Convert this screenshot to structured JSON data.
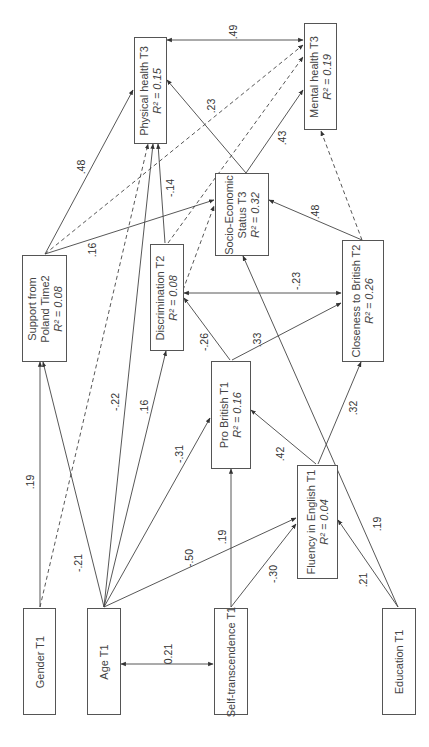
{
  "nodes": {
    "physical_health": {
      "label": "Physical health T3",
      "r2": "R² = 0.15"
    },
    "mental_health": {
      "label": "Mental health T3",
      "r2": "R² = 0.19"
    },
    "ses": {
      "label1": "Socio-Economic",
      "label2": "Status T3",
      "r2": "R² = 0.32"
    },
    "support_poland": {
      "label1": "Support from",
      "label2": "Poland Time2",
      "r2": "R² = 0.08"
    },
    "discrimination": {
      "label": "Discrimination T2",
      "r2": "R² = 0.08"
    },
    "closeness_british": {
      "label": "Closeness to British T2",
      "r2": "R² = 0.26"
    },
    "pro_british": {
      "label": "Pro British T1",
      "r2": "R² = 0.16"
    },
    "fluency_english": {
      "label": "Fluency in English T1",
      "r2": "R² = 0.04"
    },
    "gender": {
      "label": "Gender T1"
    },
    "age": {
      "label": "Age T1"
    },
    "self_transcendence": {
      "label": "Self-transcendence T1"
    },
    "education": {
      "label": "Education T1"
    }
  },
  "paths": [
    {
      "from": "Physical health T3",
      "to": "Mental health T3",
      "coef": ".49",
      "type": "correlation"
    },
    {
      "from": "Support from Poland Time2",
      "to": "Physical health T3",
      "coef": ".48",
      "type": "solid"
    },
    {
      "from": "Support from Poland Time2",
      "to": "Socio-Economic Status T3",
      "coef": ".16",
      "type": "solid"
    },
    {
      "from": "Support from Poland Time2",
      "to": "Mental health T3",
      "coef": "",
      "type": "dashed"
    },
    {
      "from": "Discrimination T2",
      "to": "Physical health T3",
      "coef": "-.14",
      "type": "solid"
    },
    {
      "from": "Discrimination T2",
      "to": "Mental health T3",
      "coef": "",
      "type": "dashed"
    },
    {
      "from": "Socio-Economic Status T3",
      "to": "Physical health T3",
      "coef": ".23",
      "type": "solid"
    },
    {
      "from": "Socio-Economic Status T3",
      "to": "Mental health T3",
      "coef": ".43",
      "type": "solid"
    },
    {
      "from": "Closeness to British T2",
      "to": "Socio-Economic Status T3",
      "coef": ".48",
      "type": "solid"
    },
    {
      "from": "Closeness to British T2",
      "to": "Mental health T3",
      "coef": "",
      "type": "dashed"
    },
    {
      "from": "Closeness to British T2",
      "to": "Discrimination T2",
      "coef": "-.23",
      "type": "solid"
    },
    {
      "from": "Pro British T1",
      "to": "Discrimination T2",
      "coef": "-.26",
      "type": "solid"
    },
    {
      "from": "Pro British T1",
      "to": "Closeness to British T2",
      "coef": ".33",
      "type": "solid"
    },
    {
      "from": "Fluency in English T1",
      "to": "Pro British T1",
      "coef": ".42",
      "type": "solid"
    },
    {
      "from": "Fluency in English T1",
      "to": "Closeness to British T2",
      "coef": ".32",
      "type": "solid"
    },
    {
      "from": "Gender T1",
      "to": "Support from Poland Time2",
      "coef": ".19",
      "type": "solid"
    },
    {
      "from": "Gender T1",
      "to": "Physical health T3",
      "coef": "",
      "type": "dashed"
    },
    {
      "from": "Age T1",
      "to": "Support from Poland Time2",
      "coef": "-.21",
      "type": "solid"
    },
    {
      "from": "Age T1",
      "to": "Physical health T3",
      "coef": "-.22",
      "type": "solid"
    },
    {
      "from": "Age T1",
      "to": "Discrimination T2",
      "coef": ".16",
      "type": "solid"
    },
    {
      "from": "Age T1",
      "to": "Pro British T1",
      "coef": "-.31",
      "type": "solid"
    },
    {
      "from": "Age T1",
      "to": "Fluency in English T1",
      "coef": "-.50",
      "type": "solid"
    },
    {
      "from": "Age T1",
      "to": "Self-transcendence T1",
      "coef": "0.21",
      "type": "correlation"
    },
    {
      "from": "Self-transcendence T1",
      "to": "Pro British T1",
      "coef": ".19",
      "type": "solid"
    },
    {
      "from": "Self-transcendence T1",
      "to": "Fluency in English T1",
      "coef": "-.30",
      "type": "solid"
    },
    {
      "from": "Education T1",
      "to": "Fluency in English T1",
      "coef": ".21",
      "type": "solid"
    },
    {
      "from": "Education T1",
      "to": "Socio-Economic Status T3",
      "coef": ".19",
      "type": "solid"
    }
  ],
  "labels": {
    "c_49": ".49",
    "c_48a": ".48",
    "c_16a": ".16",
    "c_m14": "-.14",
    "c_23": ".23",
    "c_43": ".43",
    "c_48b": ".48",
    "c_m23": "-.23",
    "c_m26": "-.26",
    "c_33": ".33",
    "c_42": ".42",
    "c_32": ".32",
    "c_19a": ".19",
    "c_m21": "-.21",
    "c_m22": "-.22",
    "c_16b": ".16",
    "c_m31": "-.31",
    "c_m50": "-.50",
    "c_021": "0.21",
    "c_19b": ".19",
    "c_m30": "-.30",
    "c_21": ".21",
    "c_19c": ".19"
  },
  "colors": {
    "line": "#444444",
    "box_border": "#555555",
    "text": "#444444"
  }
}
